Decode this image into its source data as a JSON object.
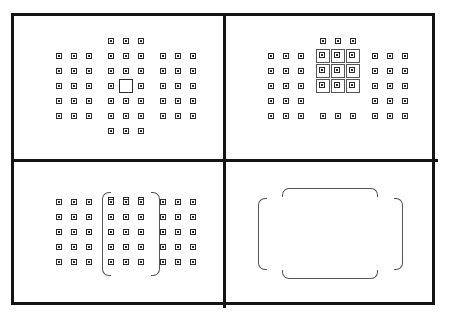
{
  "diagram": {
    "frame": {
      "border_color": "#141414",
      "background_color": "#ffffff",
      "border_width_px": 3
    },
    "colors": {
      "frame": "#141414",
      "dot_outline": "#2b2b2b",
      "dot_core": "#2b2b2b",
      "selection_box": "#555555",
      "bracket": "#555555",
      "background": "#ffffff"
    },
    "geometry": {
      "dot_pitch_x": 15,
      "dot_pitch_y": 15,
      "columns_x": [
        45,
        60,
        75,
        97,
        112,
        127,
        149,
        164,
        179
      ],
      "rows_y": [
        40,
        55,
        70,
        85,
        100
      ],
      "center_column_x": 112,
      "center_row_y": 70
    },
    "quadrants": [
      {
        "id": "top-left",
        "name": "single-point-af",
        "label": "Single-point AF",
        "center_marker": "large-open-square",
        "center_marker_x": 112,
        "center_marker_y": 70,
        "dot_columns": [
          45,
          60,
          75,
          97,
          112,
          127,
          149,
          164,
          179
        ],
        "dot_rows": [
          40,
          55,
          70,
          85,
          100
        ],
        "omitted_dots": [
          [
            112,
            70
          ]
        ],
        "side_block_rows": [
          40,
          55,
          70,
          85,
          100
        ],
        "center_block_full_rows": [
          25,
          40,
          55,
          70,
          85,
          100,
          115
        ]
      },
      {
        "id": "top-right",
        "name": "zone-af-3x3",
        "label": "Zone AF (3x3 group)",
        "boxed_columns": [
          97,
          112,
          127
        ],
        "boxed_rows": [
          40,
          55,
          70
        ],
        "plain_columns": [
          45,
          60,
          75,
          149,
          164,
          179
        ],
        "plain_rows": [
          40,
          55,
          70,
          85,
          100
        ]
      },
      {
        "id": "bottom-left",
        "name": "zone-af-vertical-bracket",
        "label": "Zone AF (vertical column bracket)",
        "bracket_left_x": 88,
        "bracket_right_x": 137,
        "bracket_top_y": 30,
        "bracket_height": 84,
        "columns_inside": [
          97,
          112,
          127
        ],
        "rows": [
          40,
          55,
          70,
          85,
          100
        ]
      },
      {
        "id": "bottom-right",
        "name": "wide-zone-af-brackets",
        "label": "Wide-zone AF (bracket outline only)",
        "left_bracket_x": 32,
        "right_bracket_x": 168,
        "vertical_bracket_top_y": 36,
        "vertical_bracket_height": 72,
        "top_bracket_x": 56,
        "top_bracket_width": 96,
        "top_bracket_y": 26,
        "bottom_bracket_y": 108
      }
    ]
  }
}
